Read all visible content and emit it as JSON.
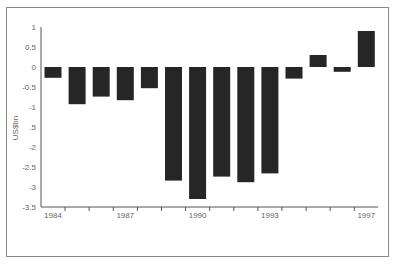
{
  "chart_data": {
    "type": "bar",
    "title": "",
    "xlabel": "",
    "ylabel": "US$bn",
    "categories": [
      "1984",
      "1985",
      "1986",
      "1987",
      "1988",
      "1989",
      "1990",
      "1991",
      "1992",
      "1993",
      "1994",
      "1995",
      "1996",
      "1997"
    ],
    "values": [
      -0.27,
      -0.93,
      -0.74,
      -0.83,
      -0.53,
      -2.84,
      -3.3,
      -2.74,
      -2.88,
      -2.66,
      -0.29,
      0.3,
      -0.12,
      0.9
    ],
    "x_tick_labels": [
      {
        "category": "1984",
        "label": "1984"
      },
      {
        "category": "1987",
        "label": "1987"
      },
      {
        "category": "1990",
        "label": "1990"
      },
      {
        "category": "1993",
        "label": "1993"
      },
      {
        "category": "1997",
        "label": "1997"
      }
    ],
    "y_ticks": [
      1,
      0.5,
      0,
      -0.5,
      -1,
      -1.5,
      -2,
      -2.5,
      -3,
      -3.5
    ],
    "y_tick_labels": [
      "1",
      "0.5",
      "0",
      "-0.5",
      "-1",
      ".5",
      "-2",
      "-2.5",
      "-3",
      "-3.5"
    ],
    "ylim": [
      -3.5,
      1
    ],
    "grid": false,
    "legend": "none",
    "bar_color": "#262626"
  }
}
